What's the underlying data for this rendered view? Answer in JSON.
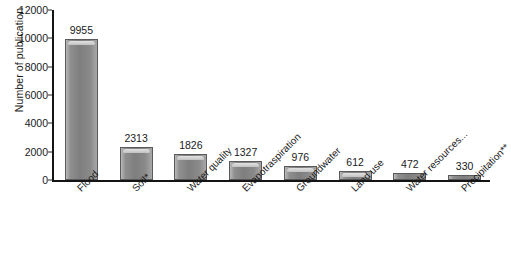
{
  "chart_data": {
    "type": "bar",
    "title": "",
    "xlabel": "",
    "ylabel": "Number of publication",
    "categories": [
      "Flood",
      "Soil*",
      "Water quality",
      "Evapotraspiration",
      "Groundwater",
      "Land use",
      "Water resources...",
      "Precipitation**"
    ],
    "values": [
      9955,
      2313,
      1826,
      1327,
      976,
      612,
      472,
      330
    ],
    "value_labels": [
      "9955",
      "2313",
      "1826",
      "1327",
      "976",
      "612",
      "472",
      "330"
    ],
    "ylim": [
      0,
      12000
    ],
    "ytick_values": [
      0,
      2000,
      4000,
      6000,
      8000,
      10000,
      12000
    ],
    "ytick_labels": [
      "0",
      "2000",
      "4000",
      "6000",
      "8000",
      "10000",
      "12000"
    ],
    "grid": false,
    "legend": false,
    "legend_position": "none",
    "bar_color": "#8a8a8a",
    "bar_edge_color": "#5a5a5a",
    "axis_color": "#141414",
    "background_color": "#ffffff",
    "text_color": "#1a1a1a"
  }
}
